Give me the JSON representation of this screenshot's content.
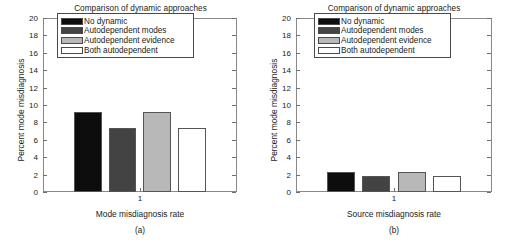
{
  "figure": {
    "panels": [
      {
        "key": "a",
        "title": "Comparison of dynamic approaches",
        "ylabel": "Percent mode misdiagnosis",
        "xlabel": "Mode misdiagnosis rate",
        "subcaption": "(a)",
        "xtick": "1"
      },
      {
        "key": "b",
        "title": "Comparison of dynamic approaches",
        "ylabel": "Percent mode misdiagnosis",
        "xlabel": "Source misdiagnosis rate",
        "subcaption": "(b)",
        "xtick": "1"
      }
    ],
    "yticks": [
      "20",
      "18",
      "16",
      "14",
      "12",
      "10",
      "8",
      "6",
      "4",
      "2",
      "0"
    ],
    "legend": [
      {
        "label": "No dynamic",
        "color": "#0d0d0d"
      },
      {
        "label": "Autodependent modes",
        "color": "#434343"
      },
      {
        "label": "Autodependent evidence",
        "color": "#b8b8b8"
      },
      {
        "label": "Both autodependent",
        "color": "#ffffff"
      }
    ]
  },
  "chart_data": [
    {
      "type": "bar",
      "panel": "(a)",
      "title": "Comparison of dynamic approaches",
      "xlabel": "Mode misdiagnosis rate",
      "ylabel": "Percent mode misdiagnosis",
      "categories": [
        "1"
      ],
      "xtick_labels": [
        "1"
      ],
      "ylim": [
        0,
        20
      ],
      "ytick_values": [
        0,
        2,
        4,
        6,
        8,
        10,
        12,
        14,
        16,
        18,
        20
      ],
      "grid": false,
      "legend_position": "upper-center",
      "series": [
        {
          "name": "No dynamic",
          "values": [
            9.2
          ],
          "color": "#0d0d0d"
        },
        {
          "name": "Autodependent modes",
          "values": [
            7.3
          ],
          "color": "#434343"
        },
        {
          "name": "Autodependent evidence",
          "values": [
            9.2
          ],
          "color": "#b8b8b8"
        },
        {
          "name": "Both autodependent",
          "values": [
            7.3
          ],
          "color": "#ffffff"
        }
      ]
    },
    {
      "type": "bar",
      "panel": "(b)",
      "title": "Comparison of dynamic approaches",
      "xlabel": "Source misdiagnosis rate",
      "ylabel": "Percent mode misdiagnosis",
      "categories": [
        "1"
      ],
      "xtick_labels": [
        "1"
      ],
      "ylim": [
        0,
        20
      ],
      "ytick_values": [
        0,
        2,
        4,
        6,
        8,
        10,
        12,
        14,
        16,
        18,
        20
      ],
      "grid": false,
      "legend_position": "upper-center",
      "series": [
        {
          "name": "No dynamic",
          "values": [
            2.3
          ],
          "color": "#0d0d0d"
        },
        {
          "name": "Autodependent modes",
          "values": [
            1.8
          ],
          "color": "#434343"
        },
        {
          "name": "Autodependent evidence",
          "values": [
            2.3
          ],
          "color": "#b8b8b8"
        },
        {
          "name": "Both autodependent",
          "values": [
            1.8
          ],
          "color": "#ffffff"
        }
      ]
    }
  ]
}
